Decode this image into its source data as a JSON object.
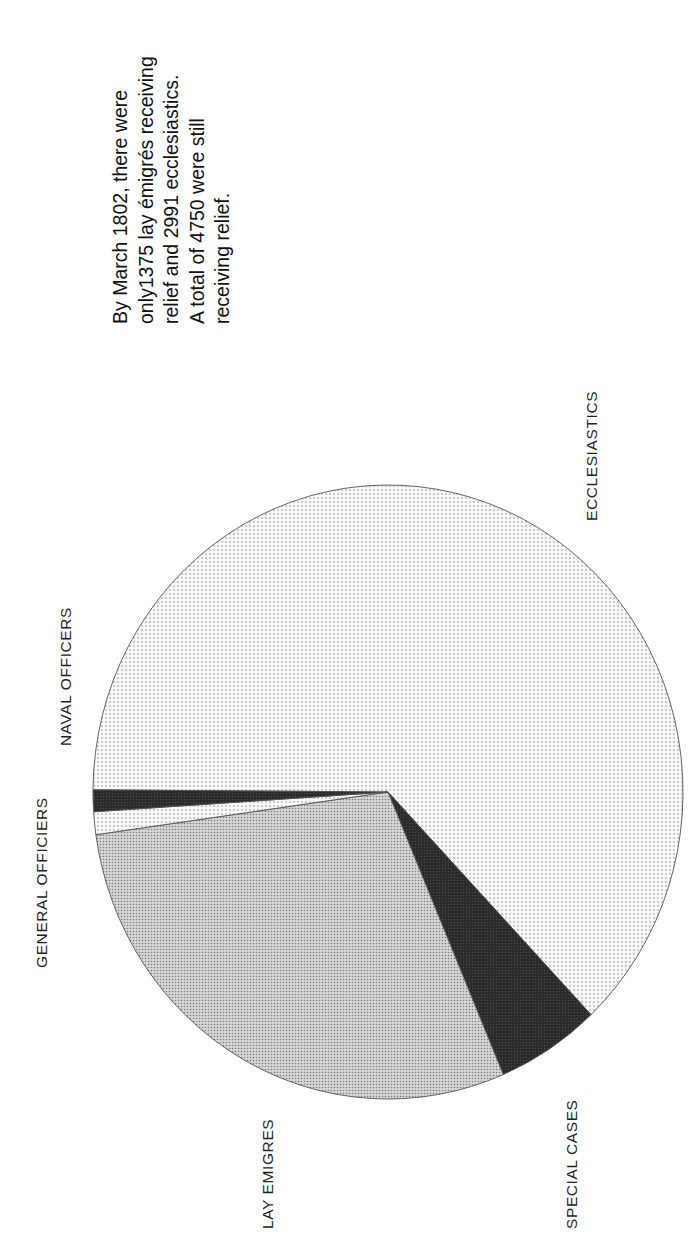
{
  "annotation": {
    "lines": [
      "By  March 1802, there were",
      "only1375 lay émigrés receiving",
      "relief and 2991 ecclesiastics.",
      "A total of 4750 were still",
      "receiving relief."
    ]
  },
  "chart_data": {
    "type": "pie",
    "title": "",
    "orientation": "rotated 90° counter-clockwise",
    "total": 4750,
    "categories": [
      "ECCLESIASTICS",
      "SPECIAL CASES",
      "LAY EMIGRES",
      "GENERAL OFFICIERS",
      "NAVAL OFFICERS"
    ],
    "values": [
      2991,
      270,
      1375,
      57,
      57
    ],
    "percentages": [
      63.0,
      5.7,
      28.9,
      1.2,
      1.2
    ],
    "slices": [
      {
        "label": "ECCLESIASTICS",
        "value": 2991,
        "start_deg": 180.4,
        "end_deg": 406.5,
        "fill": "dots-light",
        "color": "#e8e8e8"
      },
      {
        "label": "SPECIAL CASES",
        "value": 270,
        "start_deg": 46.5,
        "end_deg": 67.0,
        "fill": "dark",
        "color": "#2e2e2e"
      },
      {
        "label": "LAY EMIGRES",
        "value": 1375,
        "start_deg": 67.0,
        "end_deg": 172.0,
        "fill": "dots-medium",
        "color": "#bdbdbd"
      },
      {
        "label": "GENERAL OFFICIERS",
        "value": 57,
        "start_deg": 172.0,
        "end_deg": 176.3,
        "fill": "dots-light",
        "color": "#e8e8e8"
      },
      {
        "label": "NAVAL OFFICERS",
        "value": 57,
        "start_deg": 176.3,
        "end_deg": 180.4,
        "fill": "dark",
        "color": "#1c1c1c"
      }
    ],
    "legend": "none (direct labels)",
    "grid": false
  },
  "pie_geometry": {
    "cx": 388,
    "cy": 792,
    "rx": 295,
    "ry": 307
  },
  "labels": {
    "ecclesiastics": "ECCLESIASTICS",
    "special_cases": "SPECIAL CASES",
    "lay_emigres": "LAY EMIGRES",
    "general_officiers": "GENERAL OFFICIERS",
    "naval_officers": "NAVAL OFFICERS"
  }
}
